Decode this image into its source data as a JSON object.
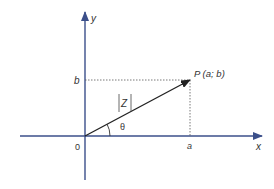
{
  "diagram": {
    "type": "complex-plane-vector",
    "axes": {
      "x_label": "x",
      "y_label": "y",
      "origin_label": "0",
      "color": "#3b4f8a"
    },
    "point": {
      "label": "P (a; b)",
      "x_label": "a",
      "y_label": "b"
    },
    "vector": {
      "magnitude_label": "Z",
      "angle_label": "θ",
      "color": "#222222"
    },
    "guide_line_style": "dotted"
  }
}
